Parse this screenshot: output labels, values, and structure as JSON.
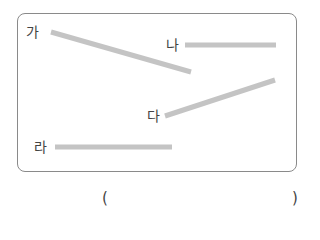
{
  "figure": {
    "line_color": "#c4c4c4",
    "line_width": 5,
    "lines": [
      {
        "label": "가",
        "x1": 51,
        "y1": 32,
        "x2": 191,
        "y2": 72,
        "type": "slanted"
      },
      {
        "label": "나",
        "x1": 185,
        "y1": 45,
        "x2": 276,
        "y2": 45,
        "type": "horizontal"
      },
      {
        "label": "다",
        "x1": 165,
        "y1": 116,
        "x2": 275,
        "y2": 80,
        "type": "slanted"
      },
      {
        "label": "라",
        "x1": 55,
        "y1": 147,
        "x2": 172,
        "y2": 147,
        "type": "horizontal"
      }
    ]
  },
  "answer": {
    "open_paren": "(",
    "close_paren": ")",
    "value": ""
  }
}
